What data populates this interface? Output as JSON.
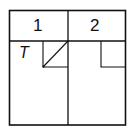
{
  "diagram": {
    "columns": [
      {
        "label": "1"
      },
      {
        "label": "2"
      }
    ],
    "cell_label": "T",
    "colors": {
      "line": "#111111",
      "background": "#ffffff"
    }
  }
}
